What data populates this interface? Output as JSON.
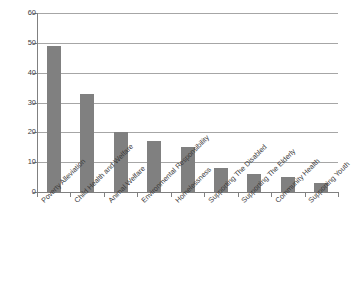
{
  "chart_data": {
    "type": "bar",
    "title": "",
    "subtitle": "",
    "xlabel": "",
    "ylabel": "",
    "ylim": [
      0,
      60
    ],
    "ytick_step": 10,
    "yticks": [
      0,
      10,
      20,
      30,
      40,
      50,
      60
    ],
    "grid": "horizontal",
    "legend": "none",
    "orientation": "vertical",
    "bar_color": "#808080",
    "gridline_color": "#a6a6a6",
    "axis_color": "#808080",
    "background_color": "#ffffff",
    "categories": [
      "Poverty Alleviation",
      "Child Health and Welfare",
      "Animal Welfare",
      "Environmental Responsibility",
      "Homelessness",
      "Supporting The Disabled",
      "Supporting The Elderly",
      "Community Health",
      "Supporting Youth"
    ],
    "values": [
      49,
      33,
      20,
      17,
      15,
      8,
      6,
      5,
      3
    ],
    "series": [
      {
        "name": "",
        "values": [
          49,
          33,
          20,
          17,
          15,
          8,
          6,
          5,
          3
        ]
      }
    ]
  }
}
